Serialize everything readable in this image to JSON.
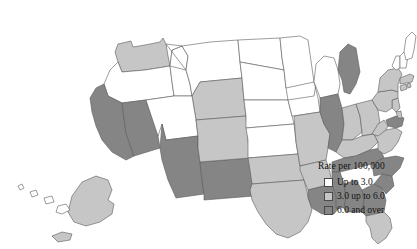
{
  "map": {
    "title": "",
    "projection": "albers-usa",
    "colors": {
      "low": "#ffffff",
      "mid": "#c6c6c6",
      "high": "#858585",
      "border": "#5a5a5a",
      "background": "#ffffff"
    }
  },
  "legend": {
    "title": "Rate per 100,000",
    "items": [
      {
        "label": "Up to 3.0",
        "color": "#ffffff",
        "bucket": "low"
      },
      {
        "label": "3.0 up to 6.0",
        "color": "#c6c6c6",
        "bucket": "mid"
      },
      {
        "label": "6.0 and over",
        "color": "#858585",
        "bucket": "high"
      }
    ]
  },
  "chart_data": {
    "type": "map",
    "title": "Rate per 100,000",
    "legend_position": "bottom-right",
    "classes": [
      {
        "label": "Up to 3.0",
        "color": "#ffffff",
        "min": 0.0,
        "max": 3.0
      },
      {
        "label": "3.0 up to 6.0",
        "color": "#c6c6c6",
        "min": 3.0,
        "max": 6.0
      },
      {
        "label": "6.0 and over",
        "color": "#858585",
        "min": 6.0,
        "max": null
      }
    ],
    "regions": [
      {
        "code": "WA",
        "name": "Washington",
        "bucket": "mid"
      },
      {
        "code": "OR",
        "name": "Oregon",
        "bucket": "low"
      },
      {
        "code": "CA",
        "name": "California",
        "bucket": "high"
      },
      {
        "code": "NV",
        "name": "Nevada",
        "bucket": "high"
      },
      {
        "code": "ID",
        "name": "Idaho",
        "bucket": "low"
      },
      {
        "code": "MT",
        "name": "Montana",
        "bucket": "low"
      },
      {
        "code": "WY",
        "name": "Wyoming",
        "bucket": "mid"
      },
      {
        "code": "UT",
        "name": "Utah",
        "bucket": "low"
      },
      {
        "code": "AZ",
        "name": "Arizona",
        "bucket": "high"
      },
      {
        "code": "NM",
        "name": "New Mexico",
        "bucket": "high"
      },
      {
        "code": "CO",
        "name": "Colorado",
        "bucket": "mid"
      },
      {
        "code": "ND",
        "name": "North Dakota",
        "bucket": "low"
      },
      {
        "code": "SD",
        "name": "South Dakota",
        "bucket": "low"
      },
      {
        "code": "NE",
        "name": "Nebraska",
        "bucket": "low"
      },
      {
        "code": "KS",
        "name": "Kansas",
        "bucket": "low"
      },
      {
        "code": "OK",
        "name": "Oklahoma",
        "bucket": "mid"
      },
      {
        "code": "TX",
        "name": "Texas",
        "bucket": "mid"
      },
      {
        "code": "MN",
        "name": "Minnesota",
        "bucket": "low"
      },
      {
        "code": "IA",
        "name": "Iowa",
        "bucket": "low"
      },
      {
        "code": "MO",
        "name": "Missouri",
        "bucket": "mid"
      },
      {
        "code": "AR",
        "name": "Arkansas",
        "bucket": "mid"
      },
      {
        "code": "LA",
        "name": "Louisiana",
        "bucket": "high"
      },
      {
        "code": "WI",
        "name": "Wisconsin",
        "bucket": "low"
      },
      {
        "code": "IL",
        "name": "Illinois",
        "bucket": "high"
      },
      {
        "code": "MI",
        "name": "Michigan",
        "bucket": "high"
      },
      {
        "code": "IN",
        "name": "Indiana",
        "bucket": "mid"
      },
      {
        "code": "OH",
        "name": "Ohio",
        "bucket": "mid"
      },
      {
        "code": "KY",
        "name": "Kentucky",
        "bucket": "mid"
      },
      {
        "code": "TN",
        "name": "Tennessee",
        "bucket": "high"
      },
      {
        "code": "MS",
        "name": "Mississippi",
        "bucket": "high"
      },
      {
        "code": "AL",
        "name": "Alabama",
        "bucket": "high"
      },
      {
        "code": "GA",
        "name": "Georgia",
        "bucket": "high"
      },
      {
        "code": "FL",
        "name": "Florida",
        "bucket": "mid"
      },
      {
        "code": "SC",
        "name": "South Carolina",
        "bucket": "high"
      },
      {
        "code": "NC",
        "name": "North Carolina",
        "bucket": "high"
      },
      {
        "code": "VA",
        "name": "Virginia",
        "bucket": "mid"
      },
      {
        "code": "WV",
        "name": "West Virginia",
        "bucket": "mid"
      },
      {
        "code": "MD",
        "name": "Maryland",
        "bucket": "high"
      },
      {
        "code": "DE",
        "name": "Delaware",
        "bucket": "mid"
      },
      {
        "code": "NJ",
        "name": "New Jersey",
        "bucket": "mid"
      },
      {
        "code": "PA",
        "name": "Pennsylvania",
        "bucket": "mid"
      },
      {
        "code": "NY",
        "name": "New York",
        "bucket": "mid"
      },
      {
        "code": "CT",
        "name": "Connecticut",
        "bucket": "mid"
      },
      {
        "code": "RI",
        "name": "Rhode Island",
        "bucket": "mid"
      },
      {
        "code": "MA",
        "name": "Massachusetts",
        "bucket": "mid"
      },
      {
        "code": "VT",
        "name": "Vermont",
        "bucket": "low"
      },
      {
        "code": "NH",
        "name": "New Hampshire",
        "bucket": "low"
      },
      {
        "code": "ME",
        "name": "Maine",
        "bucket": "low"
      },
      {
        "code": "AK",
        "name": "Alaska",
        "bucket": "mid"
      },
      {
        "code": "HI",
        "name": "Hawaii",
        "bucket": "low"
      }
    ]
  }
}
